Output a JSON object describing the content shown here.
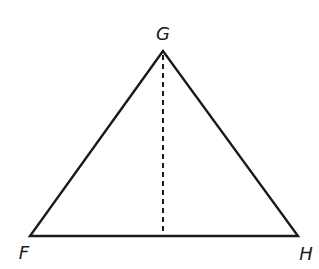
{
  "figure": {
    "type": "triangle",
    "vertices": {
      "G": {
        "label": "G",
        "x": 163,
        "y": 51
      },
      "F": {
        "label": "F",
        "x": 30,
        "y": 236
      },
      "H": {
        "label": "H",
        "x": 298,
        "y": 236
      }
    },
    "altitude": {
      "from": "G",
      "to_x": 163,
      "to_y": 236,
      "style": "dashed"
    },
    "colors": {
      "stroke": "#1a1a1a",
      "background": "#ffffff"
    }
  }
}
